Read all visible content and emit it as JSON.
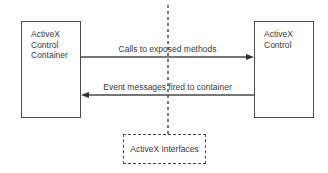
{
  "diagram": {
    "left_box": {
      "lines": [
        "ActiveX",
        "Control",
        "Container"
      ]
    },
    "right_box": {
      "lines": [
        "ActiveX",
        "Control"
      ]
    },
    "top_arrow": {
      "label": "Calls to exposed methods",
      "direction": "left-to-right"
    },
    "bottom_arrow": {
      "label": "Event messages fired to container",
      "direction": "right-to-left"
    },
    "interface_box": {
      "label": "ActiveX Interfaces",
      "style": "dashed"
    },
    "colors": {
      "stroke": "#4a4a4a",
      "text": "#3a3a3a",
      "background": "#ffffff"
    }
  }
}
